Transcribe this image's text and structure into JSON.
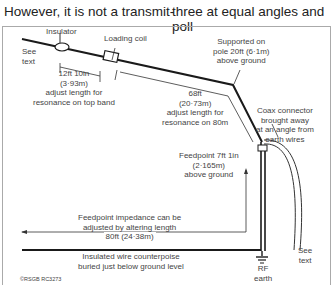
{
  "header": {
    "left_text": "However, it is not a transmit-",
    "right_text": "three at equal angles and poll"
  },
  "diagram": {
    "labels": {
      "insulator": "Insulator",
      "loading_coil": "Loading coil",
      "see_text_left": [
        "See",
        "text"
      ],
      "top_band": [
        "12ft 10in",
        "(3·93m)",
        "adjust length for",
        "resonance on top band"
      ],
      "supported": [
        "Supported on",
        "pole 20ft (6·1m)",
        "above ground"
      ],
      "eighty_m": [
        "68ft",
        "(20·73m)",
        "adjust length for",
        "resonance on 80m"
      ],
      "coax": [
        "Coax connector",
        "brought away",
        "at an angle from",
        "earth wires"
      ],
      "feedpoint": [
        "Feedpoint 7ft 1in",
        "(2·165m)",
        "above ground"
      ],
      "impedance": [
        "Feedpoint impedance can be",
        "adjusted by altering length",
        "80ft (24·38m)"
      ],
      "counterpoise": [
        "Insulated wire counterpoise",
        "buried just below ground level"
      ],
      "rf_earth": [
        "RF",
        "earth"
      ],
      "see_text_right": [
        "See",
        "text"
      ],
      "copyright": "©RSGB RC3273"
    },
    "colors": {
      "wire": "#1a1a1a",
      "line": "#333333",
      "frame": "#aaaaaa"
    }
  }
}
